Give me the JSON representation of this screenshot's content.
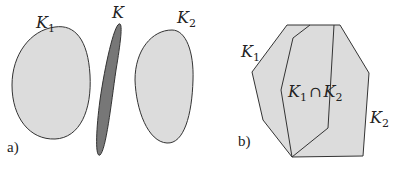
{
  "figure": {
    "panel_a": {
      "tag": "a)",
      "shapes": [
        {
          "id": "K1",
          "label": "K",
          "subscript": "1",
          "fill": "#dcdcdc",
          "stroke": "#333333"
        },
        {
          "id": "K",
          "label": "K",
          "subscript": "",
          "fill": "#777777",
          "stroke": "#333333"
        },
        {
          "id": "K2",
          "label": "K",
          "subscript": "2",
          "fill": "#dcdcdc",
          "stroke": "#333333"
        }
      ]
    },
    "panel_b": {
      "tag": "b)",
      "labels": {
        "k1": {
          "label": "K",
          "subscript": "1"
        },
        "k2": {
          "label": "K",
          "subscript": "2"
        },
        "intersection": {
          "left": "K",
          "left_sub": "1",
          "op": "∩",
          "right": "K",
          "right_sub": "2"
        }
      },
      "fill": "#dcdcdc",
      "stroke": "#333333"
    }
  }
}
